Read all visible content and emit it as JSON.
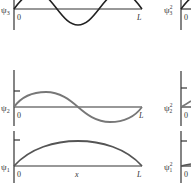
{
  "figure": {
    "left_column": {
      "panels": [
        {
          "id": "psi3",
          "label_symbol": "ψ",
          "label_sub": "3",
          "origin_label": "0",
          "end_label": "L",
          "curve": "sin(3πx/L)",
          "color": "#222222"
        },
        {
          "id": "psi2",
          "label_symbol": "ψ",
          "label_sub": "2",
          "origin_label": "0",
          "end_label": "L",
          "curve": "sin(2πx/L)",
          "color": "#777777"
        },
        {
          "id": "psi1",
          "label_symbol": "ψ",
          "label_sub": "1",
          "origin_label": "0",
          "mid_label": "x",
          "end_label": "L",
          "curve": "sin(πx/L)",
          "color": "#555555"
        }
      ]
    },
    "right_column": {
      "panels": [
        {
          "id": "psi3sq",
          "label_symbol": "ψ",
          "label_sup": "2",
          "label_sub": "3",
          "origin_label": "0"
        },
        {
          "id": "psi2sq",
          "label_symbol": "ψ",
          "label_sup": "2",
          "label_sub": "2",
          "origin_label": "0"
        },
        {
          "id": "psi1sq",
          "label_symbol": "ψ",
          "label_sup": "2",
          "label_sub": "1",
          "origin_label": "0"
        }
      ]
    },
    "colors": {
      "axis": "#333333",
      "psi3": "#222222",
      "psi2": "#777777",
      "psi1": "#555555"
    }
  }
}
